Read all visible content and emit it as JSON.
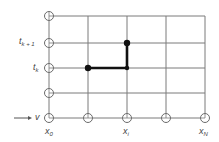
{
  "diagram": {
    "colors": {
      "grid": "#7a7a7a",
      "path": "#111111",
      "label": "#444444",
      "background": "#ffffff"
    },
    "grid": {
      "x_positions": [
        49,
        88,
        127,
        166,
        205
      ],
      "y_positions": [
        16,
        43,
        68,
        93,
        118
      ]
    },
    "boundary_nodes": {
      "left_column": [
        [
          49,
          16
        ],
        [
          49,
          43
        ],
        [
          49,
          68
        ],
        [
          49,
          93
        ],
        [
          49,
          118
        ]
      ],
      "bottom_row": [
        [
          88,
          118
        ],
        [
          127,
          118
        ],
        [
          166,
          118
        ],
        [
          205,
          118
        ]
      ]
    },
    "highlight_path": {
      "points": [
        [
          88,
          68
        ],
        [
          127,
          68
        ],
        [
          127,
          43
        ]
      ],
      "dots": [
        [
          88,
          68
        ],
        [
          127,
          43
        ]
      ]
    },
    "labels": {
      "t_k_plus_1": {
        "base": "t",
        "sub": "k + 1"
      },
      "t_k": {
        "base": "t",
        "sub": "k"
      },
      "v_arrow": {
        "text": "v"
      },
      "x_0": {
        "base": "x",
        "sub": "0"
      },
      "x_i": {
        "base": "x",
        "sub": "i"
      },
      "x_N": {
        "base": "x",
        "sub": "N"
      }
    }
  }
}
